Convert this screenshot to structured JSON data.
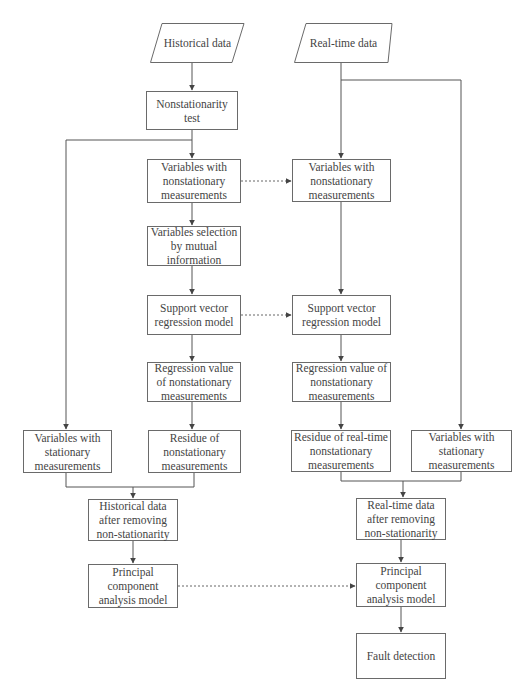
{
  "inputs": {
    "historical": "Historical data",
    "realtime": "Real-time data"
  },
  "left": {
    "nonstationarity_test": "Nonstationarity test",
    "variables_nonstationary": "Variables with nonstationary measurements",
    "variables_selection": "Variables selection by mutual information",
    "svr_model": "Support vector regression model",
    "regression_value": "Regression value of nonstationary measurements",
    "residue": "Residue of nonstationary measurements",
    "variables_stationary": "Variables with stationary measurements",
    "data_after_removing": "Historical data after removing non-stationarity",
    "pca_model": "Principal component analysis model"
  },
  "right": {
    "variables_nonstationary": "Variables with nonstationary measurements",
    "svr_model": "Support vector regression model",
    "regression_value": "Regression value of nonstationary measurements",
    "residue": "Residue of real-time nonstationary measurements",
    "variables_stationary": "Variables with stationary measurements",
    "data_after_removing": "Real-time data after removing non-stationarity",
    "pca_model": "Principal component analysis model",
    "fault_detection": "Fault detection"
  },
  "colors": {
    "line": "#555555",
    "box_border": "#6a6a6a",
    "text": "#444444"
  }
}
